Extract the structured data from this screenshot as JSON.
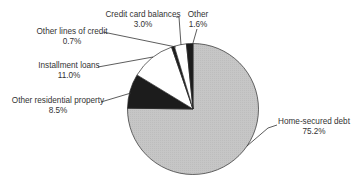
{
  "chart_data": {
    "type": "pie",
    "title": "",
    "start_angle": "12 o'clock",
    "direction": "clockwise",
    "categories": [
      "Home-secured debt",
      "Other residential property",
      "Installment loans",
      "Other lines of credit",
      "Credit card balances",
      "Other"
    ],
    "values": [
      75.2,
      8.5,
      11.0,
      0.7,
      3.0,
      1.6
    ],
    "value_labels": [
      "75.2%",
      "8.5%",
      "11.0%",
      "0.7%",
      "3.0%",
      "1.6%"
    ],
    "colors": [
      "#c6c6c6",
      "#1c1c1c",
      "#ffffff",
      "#1c1c1c",
      "#ffffff",
      "#1c1c1c"
    ],
    "legend": "none (leader-line labels)"
  },
  "labels": [
    {
      "name": "Home-secured debt",
      "value": "75.2%"
    },
    {
      "name": "Other residential property",
      "value": "8.5%"
    },
    {
      "name": "Installment loans",
      "value": "11.0%"
    },
    {
      "name": "Other lines of credit",
      "value": "0.7%"
    },
    {
      "name": "Credit card balances",
      "value": "3.0%"
    },
    {
      "name": "Other",
      "value": "1.6%"
    }
  ]
}
